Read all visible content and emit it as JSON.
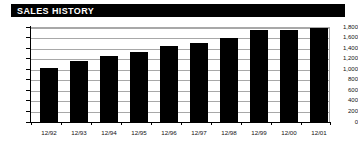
{
  "panel": {
    "title": "SALES HISTORY",
    "title_bar_color": "#000000",
    "title_text_color": "#FFFFFF",
    "background_color": "#FFFFFF"
  },
  "chart_data": {
    "type": "bar",
    "title": "SALES HISTORY",
    "xlabel": "",
    "ylabel": "",
    "categories": [
      "12/92",
      "12/93",
      "12/94",
      "12/95",
      "12/96",
      "12/97",
      "12/98",
      "12/99",
      "12/00",
      "12/01"
    ],
    "values": [
      1040,
      1175,
      1265,
      1350,
      1460,
      1505,
      1600,
      1760,
      1765,
      1800
    ],
    "ylim": [
      0,
      1800
    ],
    "ytick_values": [
      0,
      200,
      400,
      600,
      800,
      1000,
      1200,
      1400,
      1600,
      1800
    ],
    "ytick_labels": [
      "0",
      "200",
      "400",
      "600",
      "800",
      "1,000",
      "1,200",
      "1,400",
      "1,600",
      "1,800"
    ],
    "grid": true,
    "grid_axis": "y",
    "grid_color": "#A8A8A8",
    "legend": null,
    "bar_color": "#000000",
    "axis_color": "#000000"
  }
}
